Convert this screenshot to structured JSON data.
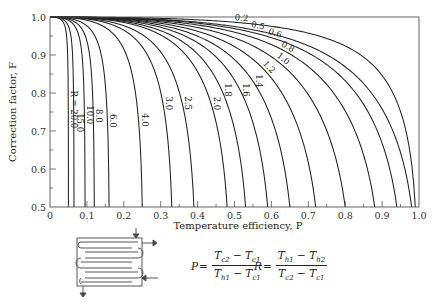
{
  "chart_data": {
    "type": "line",
    "title": "",
    "xlabel": "Temperature efficiency, P",
    "ylabel": "Correction factor, F",
    "xlim": [
      0,
      1.0
    ],
    "ylim": [
      0.5,
      1.0
    ],
    "grid": false,
    "x_ticks": [
      "0",
      "0.1",
      "0.2",
      "0.3",
      "0.4",
      "0.5",
      "0.6",
      "0.7",
      "0.8",
      "0.9",
      "1.0"
    ],
    "y_ticks": [
      "0.5",
      "0.6",
      "0.7",
      "0.8",
      "0.9",
      "1.0"
    ],
    "series_label_prefix": "R = ",
    "series": [
      {
        "name": "20.0",
        "R": 20.0,
        "P_at_F_0.5": 0.05
      },
      {
        "name": "15.0",
        "R": 15.0,
        "P_at_F_0.5": 0.065
      },
      {
        "name": "10.0",
        "R": 10.0,
        "P_at_F_0.5": 0.095
      },
      {
        "name": "8.0",
        "R": 8.0,
        "P_at_F_0.5": 0.12
      },
      {
        "name": "6.0",
        "R": 6.0,
        "P_at_F_0.5": 0.16
      },
      {
        "name": "4.0",
        "R": 4.0,
        "P_at_F_0.5": 0.25
      },
      {
        "name": "3.0",
        "R": 3.0,
        "P_at_F_0.5": 0.33
      },
      {
        "name": "2.5",
        "R": 2.5,
        "P_at_F_0.5": 0.39
      },
      {
        "name": "2.0",
        "R": 2.0,
        "P_at_F_0.5": 0.48
      },
      {
        "name": "1.8",
        "R": 1.8,
        "P_at_F_0.5": 0.53
      },
      {
        "name": "1.6",
        "R": 1.6,
        "P_at_F_0.5": 0.59
      },
      {
        "name": "1.4",
        "R": 1.4,
        "P_at_F_0.5": 0.65
      },
      {
        "name": "1.2",
        "R": 1.2,
        "P_at_F_0.5": 0.72
      },
      {
        "name": "1.0",
        "R": 1.0,
        "P_at_F_0.5": 0.8
      },
      {
        "name": "0.8",
        "R": 0.8,
        "P_at_F_0.5": 0.88
      },
      {
        "name": "0.6",
        "R": 0.6,
        "P_at_F_0.5": 0.94
      },
      {
        "name": "0.5",
        "R": 0.5,
        "P_at_F_0.5": 0.98
      },
      {
        "name": "0.2",
        "R": 0.2,
        "P_at_F_0.5": 0.99
      }
    ],
    "annotations": {
      "formula_P": {
        "lhs": "P",
        "num": [
          "T",
          "c2",
          " − ",
          "T",
          "c1"
        ],
        "den": [
          "T",
          "h1",
          " − ",
          "T",
          "c1"
        ]
      },
      "formula_R": {
        "lhs": "R",
        "num": [
          "T",
          "h1",
          " − ",
          "T",
          "h2"
        ],
        "den": [
          "T",
          "c2",
          " − ",
          "T",
          "c1"
        ]
      }
    }
  },
  "colors": {
    "line": "#222222",
    "frame": "#555555",
    "background": "#ffffff"
  }
}
